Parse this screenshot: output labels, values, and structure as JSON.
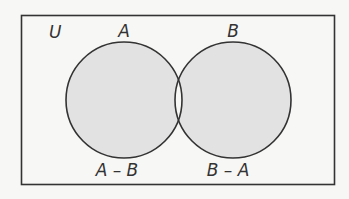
{
  "diagram": {
    "type": "venn",
    "universe_label": "U",
    "sets": [
      {
        "name": "A",
        "label": "A"
      },
      {
        "name": "B",
        "label": "B"
      }
    ],
    "regions": [
      {
        "name": "A-B",
        "label": "A – B",
        "shaded": true
      },
      {
        "name": "B-A",
        "label": "B – A",
        "shaded": true
      },
      {
        "name": "A∩B",
        "label": "",
        "shaded": false
      }
    ],
    "colors": {
      "stroke": "#333333",
      "shade": "#e2e2e2",
      "background": "#f7f7f5",
      "intersection": "#f7f7f5"
    }
  }
}
